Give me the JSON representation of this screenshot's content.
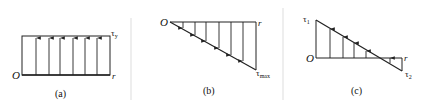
{
  "panels": [
    {
      "id": "a",
      "caption": "(a)",
      "origin_label": "O",
      "axis_label": "r",
      "stress_label": "τ",
      "stress_sub": "y",
      "description": "uniform shear stress distribution"
    },
    {
      "id": "b",
      "caption": "(b)",
      "origin_label": "O",
      "axis_label": "r",
      "stress_label": "τ",
      "stress_sub": "max",
      "description": "linear shear stress increasing to maximum"
    },
    {
      "id": "c",
      "caption": "(c)",
      "origin_label": "O",
      "axis_label": "r",
      "stress_label_1": "τ",
      "stress_sub_1": "1",
      "stress_label_2": "τ",
      "stress_sub_2": "2",
      "description": "linear shear stress changing sign"
    }
  ],
  "colors": {
    "line": "#222222",
    "divider": "#dddddd",
    "background": "#ffffff"
  }
}
